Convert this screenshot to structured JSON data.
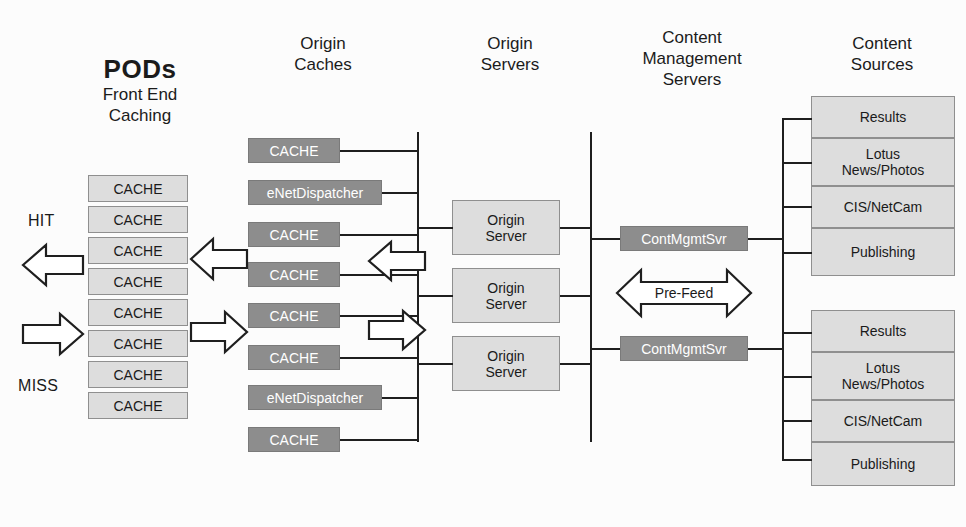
{
  "diagram": {
    "columns": [
      {
        "id": "pods",
        "title": "PODs",
        "subtitle": "Front End\nCaching"
      },
      {
        "id": "origin_caches",
        "title": "Origin\nCaches"
      },
      {
        "id": "origin_servers",
        "title": "Origin\nServers"
      },
      {
        "id": "cms",
        "title": "Content\nManagement\nServers"
      },
      {
        "id": "content_src",
        "title": "Content\nSources"
      }
    ],
    "pods": {
      "nodes": [
        {
          "label": "CACHE"
        },
        {
          "label": "CACHE"
        },
        {
          "label": "CACHE"
        },
        {
          "label": "CACHE"
        },
        {
          "label": "CACHE"
        },
        {
          "label": "CACHE"
        },
        {
          "label": "CACHE"
        },
        {
          "label": "CACHE"
        }
      ],
      "hit_label": "HIT",
      "miss_label": "MISS"
    },
    "origin_caches": {
      "nodes": [
        {
          "label": "CACHE",
          "wide": false
        },
        {
          "label": "eNetDispatcher",
          "wide": true
        },
        {
          "label": "CACHE",
          "wide": false
        },
        {
          "label": "CACHE",
          "wide": false
        },
        {
          "label": "CACHE",
          "wide": false
        },
        {
          "label": "CACHE",
          "wide": false
        },
        {
          "label": "eNetDispatcher",
          "wide": true
        },
        {
          "label": "CACHE",
          "wide": false
        }
      ]
    },
    "origin_servers": {
      "nodes": [
        {
          "label": "Origin\nServer"
        },
        {
          "label": "Origin\nServer"
        },
        {
          "label": "Origin\nServer"
        }
      ]
    },
    "cms": {
      "nodes": [
        {
          "label": "ContMgmtSvr"
        },
        {
          "label": "ContMgmtSvr"
        }
      ],
      "prefeed_label": "Pre-Feed"
    },
    "content_sources": {
      "groups": [
        {
          "nodes": [
            {
              "label": "Results"
            },
            {
              "label": "Lotus\nNews/Photos"
            },
            {
              "label": "CIS/NetCam"
            },
            {
              "label": "Publishing"
            }
          ]
        },
        {
          "nodes": [
            {
              "label": "Results"
            },
            {
              "label": "Lotus\nNews/Photos"
            },
            {
              "label": "CIS/NetCam"
            },
            {
              "label": "Publishing"
            }
          ]
        }
      ]
    },
    "colors": {
      "dark_node_fill": "#8d8d8d",
      "dark_node_text": "#ffffff",
      "light_node_fill": "#dddddd",
      "line": "#1f1f1f",
      "background": "#fcfcfc"
    }
  }
}
